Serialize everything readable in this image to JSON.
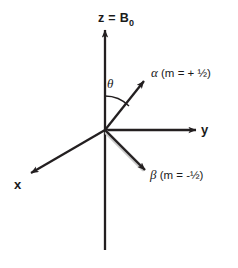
{
  "figure": {
    "background_color": "#ffffff",
    "line_color": "#231f20",
    "text_color": "#1a1a1a"
  },
  "axes": {
    "z": {
      "name": "z-axis",
      "label": "z = B",
      "label_subscript": "0",
      "direction": "up"
    },
    "y": {
      "name": "y-axis",
      "label": "y",
      "direction": "right"
    },
    "x": {
      "name": "x-axis",
      "label": "x",
      "direction": "down-left"
    }
  },
  "vectors": {
    "alpha": {
      "name": "alpha-spin-vector",
      "greek": "α",
      "text": " (m = + ½)"
    },
    "beta": {
      "name": "beta-spin-vector",
      "greek": "β",
      "text": " (m = -½)"
    }
  },
  "angle": {
    "name": "theta-angle",
    "symbol": "θ"
  }
}
